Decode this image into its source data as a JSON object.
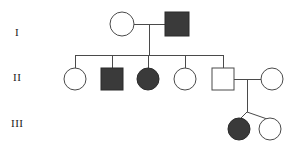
{
  "figure": {
    "kind": "pedigree-chart",
    "width": 300,
    "height": 149,
    "background_color": "#ffffff",
    "line_color": "#4a4a4a",
    "affected_fill_color": "#3a3a3a",
    "unaffected_fill_color": "#ffffff"
  },
  "generation_labels": [
    {
      "id": "gen-1",
      "text": "I",
      "x": 15,
      "y": 27
    },
    {
      "id": "gen-2",
      "text": "II",
      "x": 13,
      "y": 72
    },
    {
      "id": "gen-3",
      "text": "III",
      "x": 11,
      "y": 118
    }
  ],
  "legend_semantics": {
    "square": "male",
    "circle": "female",
    "filled": "affected",
    "open": "unaffected"
  },
  "individuals": [
    {
      "id": "I-1",
      "generation": "I",
      "shape": "circle",
      "sex": "female",
      "status": "unaffected",
      "cx": 122,
      "cy": 24,
      "r": 12
    },
    {
      "id": "I-2",
      "generation": "I",
      "shape": "square",
      "sex": "male",
      "status": "affected",
      "x": 165,
      "y": 12,
      "size": 24
    },
    {
      "id": "II-1",
      "generation": "II",
      "shape": "circle",
      "sex": "female",
      "status": "unaffected",
      "cx": 75,
      "cy": 79,
      "r": 11
    },
    {
      "id": "II-2",
      "generation": "II",
      "shape": "square",
      "sex": "male",
      "status": "affected",
      "x": 101,
      "y": 68,
      "size": 22
    },
    {
      "id": "II-3",
      "generation": "II",
      "shape": "circle",
      "sex": "female",
      "status": "affected",
      "cx": 148,
      "cy": 79,
      "r": 11
    },
    {
      "id": "II-4",
      "generation": "II",
      "shape": "circle",
      "sex": "female",
      "status": "unaffected",
      "cx": 185,
      "cy": 79,
      "r": 11
    },
    {
      "id": "II-5",
      "generation": "II",
      "shape": "square",
      "sex": "male",
      "status": "unaffected",
      "x": 212,
      "y": 68,
      "size": 22
    },
    {
      "id": "II-6",
      "generation": "II",
      "shape": "circle",
      "sex": "female",
      "status": "unaffected",
      "cx": 272,
      "cy": 79,
      "r": 11
    },
    {
      "id": "III-1",
      "generation": "III",
      "shape": "circle",
      "sex": "female",
      "status": "affected",
      "cx": 239,
      "cy": 129,
      "r": 11
    },
    {
      "id": "III-2",
      "generation": "III",
      "shape": "circle",
      "sex": "female",
      "status": "unaffected",
      "cx": 270,
      "cy": 129,
      "r": 11
    }
  ],
  "connections": [
    {
      "id": "mate-line-I",
      "type": "mating-line",
      "points": "134,24 165,24"
    },
    {
      "id": "descent-I",
      "type": "descent-line",
      "points": "149,24 149,55"
    },
    {
      "id": "sibship-bar-II",
      "type": "sibship-line",
      "points": "75,55 223,55"
    },
    {
      "id": "drop-II-1",
      "type": "drop-line",
      "points": "75,55 75,68"
    },
    {
      "id": "drop-II-2",
      "type": "drop-line",
      "points": "112,55 112,68"
    },
    {
      "id": "drop-II-3",
      "type": "drop-line",
      "points": "148,55 148,68"
    },
    {
      "id": "drop-II-4",
      "type": "drop-line",
      "points": "185,55 185,68"
    },
    {
      "id": "drop-II-5",
      "type": "drop-line",
      "points": "223,55 223,68"
    },
    {
      "id": "mate-line-II",
      "type": "mating-line",
      "points": "234,79 261,79"
    },
    {
      "id": "descent-II",
      "type": "descent-line",
      "points": "247,79 247,112"
    },
    {
      "id": "twin-left",
      "type": "twin-line",
      "points": "247,112 239,119"
    },
    {
      "id": "twin-right",
      "type": "twin-line",
      "points": "247,112 270,119"
    }
  ]
}
